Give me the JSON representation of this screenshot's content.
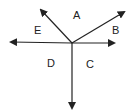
{
  "diagram": {
    "center": [
      72,
      43
    ],
    "rays": [
      {
        "name": "ray-upper-left",
        "tip": [
          39,
          8
        ]
      },
      {
        "name": "ray-upper-right",
        "tip": [
          126,
          11
        ]
      },
      {
        "name": "ray-right",
        "tip": [
          116,
          43
        ]
      },
      {
        "name": "ray-left",
        "tip": [
          9,
          42
        ]
      },
      {
        "name": "ray-down",
        "tip": [
          72,
          110
        ]
      }
    ],
    "labels": {
      "A": "A",
      "B": "B",
      "C": "C",
      "D": "D",
      "E": "E"
    },
    "stroke_color": "#222222"
  }
}
